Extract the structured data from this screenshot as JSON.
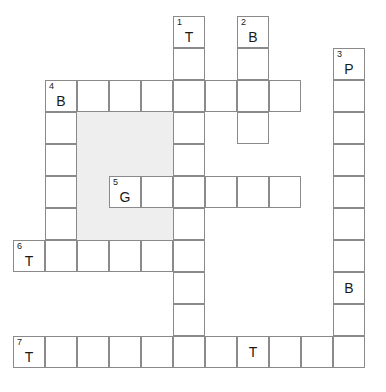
{
  "puzzle": {
    "title": "Crossword Grid",
    "cell_size": 32,
    "origin_x": 13,
    "origin_y": 16,
    "columns": 11,
    "rows": 11,
    "grid_line_color": "#8a8a8a",
    "shade_color": "#eeeeee",
    "cell_background": "#ffffff",
    "page_background": "#ffffff",
    "text_color": "#1a1a1a"
  },
  "shaded_regions": [
    {
      "name": "shaded-block-center",
      "col": 2,
      "row": 3,
      "cols": 3,
      "rows": 4
    }
  ],
  "cells": [
    {
      "name": "cell-r0c5",
      "col": 5,
      "row": 0,
      "number": "1",
      "letter": "T"
    },
    {
      "name": "cell-r0c7",
      "col": 7,
      "row": 0,
      "number": "2",
      "letter": "B"
    },
    {
      "name": "cell-r1c5",
      "col": 5,
      "row": 1,
      "number": "",
      "letter": ""
    },
    {
      "name": "cell-r1c7",
      "col": 7,
      "row": 1,
      "number": "",
      "letter": ""
    },
    {
      "name": "cell-r1c10",
      "col": 10,
      "row": 1,
      "number": "3",
      "letter": "P"
    },
    {
      "name": "cell-r2c1",
      "col": 1,
      "row": 2,
      "number": "4",
      "letter": "B"
    },
    {
      "name": "cell-r2c2",
      "col": 2,
      "row": 2,
      "number": "",
      "letter": ""
    },
    {
      "name": "cell-r2c3",
      "col": 3,
      "row": 2,
      "number": "",
      "letter": ""
    },
    {
      "name": "cell-r2c4",
      "col": 4,
      "row": 2,
      "number": "",
      "letter": ""
    },
    {
      "name": "cell-r2c5",
      "col": 5,
      "row": 2,
      "number": "",
      "letter": ""
    },
    {
      "name": "cell-r2c6",
      "col": 6,
      "row": 2,
      "number": "",
      "letter": ""
    },
    {
      "name": "cell-r2c7",
      "col": 7,
      "row": 2,
      "number": "",
      "letter": ""
    },
    {
      "name": "cell-r2c8",
      "col": 8,
      "row": 2,
      "number": "",
      "letter": ""
    },
    {
      "name": "cell-r2c10",
      "col": 10,
      "row": 2,
      "number": "",
      "letter": ""
    },
    {
      "name": "cell-r3c1",
      "col": 1,
      "row": 3,
      "number": "",
      "letter": ""
    },
    {
      "name": "cell-r3c5",
      "col": 5,
      "row": 3,
      "number": "",
      "letter": ""
    },
    {
      "name": "cell-r3c7",
      "col": 7,
      "row": 3,
      "number": "",
      "letter": ""
    },
    {
      "name": "cell-r3c10",
      "col": 10,
      "row": 3,
      "number": "",
      "letter": ""
    },
    {
      "name": "cell-r4c1",
      "col": 1,
      "row": 4,
      "number": "",
      "letter": ""
    },
    {
      "name": "cell-r4c5",
      "col": 5,
      "row": 4,
      "number": "",
      "letter": ""
    },
    {
      "name": "cell-r4c10",
      "col": 10,
      "row": 4,
      "number": "",
      "letter": ""
    },
    {
      "name": "cell-r5c1",
      "col": 1,
      "row": 5,
      "number": "",
      "letter": ""
    },
    {
      "name": "cell-r5c3",
      "col": 3,
      "row": 5,
      "number": "5",
      "letter": "G"
    },
    {
      "name": "cell-r5c4",
      "col": 4,
      "row": 5,
      "number": "",
      "letter": ""
    },
    {
      "name": "cell-r5c5",
      "col": 5,
      "row": 5,
      "number": "",
      "letter": ""
    },
    {
      "name": "cell-r5c6",
      "col": 6,
      "row": 5,
      "number": "",
      "letter": ""
    },
    {
      "name": "cell-r5c7",
      "col": 7,
      "row": 5,
      "number": "",
      "letter": ""
    },
    {
      "name": "cell-r5c8",
      "col": 8,
      "row": 5,
      "number": "",
      "letter": ""
    },
    {
      "name": "cell-r5c10",
      "col": 10,
      "row": 5,
      "number": "",
      "letter": ""
    },
    {
      "name": "cell-r6c1",
      "col": 1,
      "row": 6,
      "number": "",
      "letter": ""
    },
    {
      "name": "cell-r6c5",
      "col": 5,
      "row": 6,
      "number": "",
      "letter": ""
    },
    {
      "name": "cell-r6c10",
      "col": 10,
      "row": 6,
      "number": "",
      "letter": ""
    },
    {
      "name": "cell-r7c0",
      "col": 0,
      "row": 7,
      "number": "6",
      "letter": "T"
    },
    {
      "name": "cell-r7c1",
      "col": 1,
      "row": 7,
      "number": "",
      "letter": ""
    },
    {
      "name": "cell-r7c2",
      "col": 2,
      "row": 7,
      "number": "",
      "letter": ""
    },
    {
      "name": "cell-r7c3",
      "col": 3,
      "row": 7,
      "number": "",
      "letter": ""
    },
    {
      "name": "cell-r7c4",
      "col": 4,
      "row": 7,
      "number": "",
      "letter": ""
    },
    {
      "name": "cell-r7c5",
      "col": 5,
      "row": 7,
      "number": "",
      "letter": ""
    },
    {
      "name": "cell-r7c10",
      "col": 10,
      "row": 7,
      "number": "",
      "letter": ""
    },
    {
      "name": "cell-r8c5",
      "col": 5,
      "row": 8,
      "number": "",
      "letter": ""
    },
    {
      "name": "cell-r8c10",
      "col": 10,
      "row": 8,
      "number": "",
      "letter": "B"
    },
    {
      "name": "cell-r9c5",
      "col": 5,
      "row": 9,
      "number": "",
      "letter": ""
    },
    {
      "name": "cell-r9c10",
      "col": 10,
      "row": 9,
      "number": "",
      "letter": ""
    },
    {
      "name": "cell-r10c0",
      "col": 0,
      "row": 10,
      "number": "7",
      "letter": "T"
    },
    {
      "name": "cell-r10c1",
      "col": 1,
      "row": 10,
      "number": "",
      "letter": ""
    },
    {
      "name": "cell-r10c2",
      "col": 2,
      "row": 10,
      "number": "",
      "letter": ""
    },
    {
      "name": "cell-r10c3",
      "col": 3,
      "row": 10,
      "number": "",
      "letter": ""
    },
    {
      "name": "cell-r10c4",
      "col": 4,
      "row": 10,
      "number": "",
      "letter": ""
    },
    {
      "name": "cell-r10c5",
      "col": 5,
      "row": 10,
      "number": "",
      "letter": ""
    },
    {
      "name": "cell-r10c6",
      "col": 6,
      "row": 10,
      "number": "",
      "letter": ""
    },
    {
      "name": "cell-r10c7",
      "col": 7,
      "row": 10,
      "number": "",
      "letter": "T"
    },
    {
      "name": "cell-r10c8",
      "col": 8,
      "row": 10,
      "number": "",
      "letter": ""
    },
    {
      "name": "cell-r10c9",
      "col": 9,
      "row": 10,
      "number": "",
      "letter": ""
    },
    {
      "name": "cell-r10c10",
      "col": 10,
      "row": 10,
      "number": "",
      "letter": ""
    }
  ]
}
